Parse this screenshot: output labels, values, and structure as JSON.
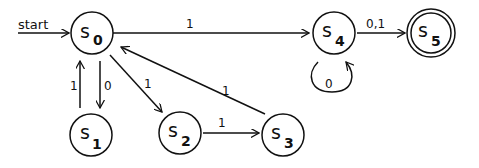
{
  "diagram": {
    "type": "finite-state-automaton",
    "start_label": "start",
    "states": [
      {
        "id": "s0",
        "name": "s",
        "sub": "0",
        "accepting": false,
        "start": true
      },
      {
        "id": "s1",
        "name": "s",
        "sub": "1",
        "accepting": false
      },
      {
        "id": "s2",
        "name": "s",
        "sub": "2",
        "accepting": false
      },
      {
        "id": "s3",
        "name": "s",
        "sub": "3",
        "accepting": false
      },
      {
        "id": "s4",
        "name": "s",
        "sub": "4",
        "accepting": false
      },
      {
        "id": "s5",
        "name": "s",
        "sub": "5",
        "accepting": true
      }
    ],
    "transitions": [
      {
        "from": "s0",
        "to": "s4",
        "label": "1"
      },
      {
        "from": "s0",
        "to": "s1",
        "label": "0"
      },
      {
        "from": "s1",
        "to": "s0",
        "label": "1"
      },
      {
        "from": "s0",
        "to": "s2",
        "label": "1"
      },
      {
        "from": "s2",
        "to": "s3",
        "label": "1"
      },
      {
        "from": "s3",
        "to": "s0",
        "label": "1"
      },
      {
        "from": "s4",
        "to": "s4",
        "label": "0"
      },
      {
        "from": "s4",
        "to": "s5",
        "label": "0,1"
      }
    ]
  }
}
